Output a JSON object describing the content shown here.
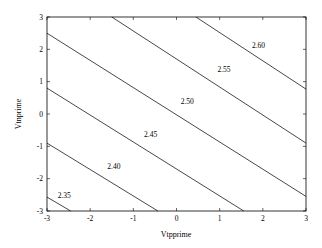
{
  "chart_data": {
    "type": "contour",
    "title": "",
    "xlabel": "Vtpprime",
    "ylabel": "Vtnprime",
    "xlim": [
      -3,
      3
    ],
    "ylim": [
      -3,
      3
    ],
    "xticks": [
      "-3",
      "-2",
      "-1",
      "0",
      "1",
      "2",
      "3"
    ],
    "yticks": [
      "-3",
      "-2",
      "-1",
      "0",
      "1",
      "2",
      "3"
    ],
    "grid": false,
    "contours": [
      {
        "level": "2.35",
        "points": [
          [
            -3,
            -2.57
          ],
          [
            -2.45,
            -3
          ]
        ],
        "label_pos": [
          -2.6,
          -2.6
        ]
      },
      {
        "level": "2.40",
        "points": [
          [
            -3,
            -0.9
          ],
          [
            -0.43,
            -3
          ]
        ],
        "label_pos": [
          -1.45,
          -1.7
        ]
      },
      {
        "level": "2.45",
        "points": [
          [
            -3,
            0.8
          ],
          [
            1.56,
            -3
          ]
        ],
        "label_pos": [
          -0.6,
          -0.7
        ]
      },
      {
        "level": "2.50",
        "points": [
          [
            -3,
            2.5
          ],
          [
            3,
            -2.55
          ]
        ],
        "label_pos": [
          0.25,
          0.3
        ]
      },
      {
        "level": "2.55",
        "points": [
          [
            -1.5,
            3
          ],
          [
            3,
            -0.9
          ]
        ],
        "label_pos": [
          1.1,
          1.3
        ]
      },
      {
        "level": "2.60",
        "points": [
          [
            0.45,
            3
          ],
          [
            3,
            0.77
          ]
        ],
        "label_pos": [
          1.9,
          2.05
        ]
      }
    ]
  }
}
